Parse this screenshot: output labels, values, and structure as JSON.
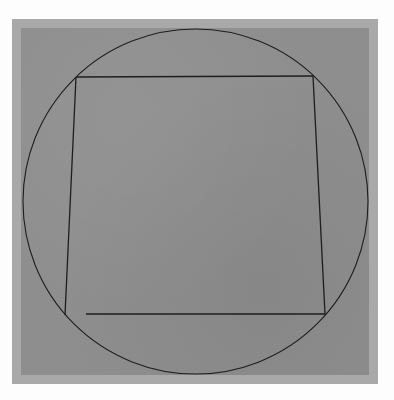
{
  "artwork": {
    "background_color": "#fdfdfd",
    "mat_color": "#a9a9a9",
    "paper_color": "#8e8e8e",
    "line_color": "#1e1e1e",
    "circle": {
      "cx": 195.5,
      "cy": 201.5,
      "r": 172.5
    },
    "quadrilateral": {
      "top_left": [
        76,
        77
      ],
      "top_right": [
        313,
        76
      ],
      "bottom_right": [
        325,
        314
      ],
      "bottom_left": [
        65,
        315
      ],
      "bottom_edge_start": [
        86,
        314
      ]
    }
  }
}
